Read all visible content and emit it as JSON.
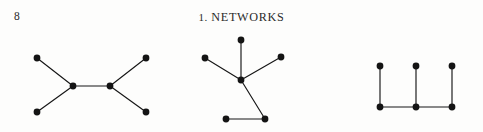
{
  "page": {
    "background_color": "#fdfdfc",
    "ink_color": "#141414",
    "width": 483,
    "height": 132
  },
  "running_head": {
    "folio": "8",
    "chapter_number": "1.",
    "chapter_title": "NETWORKS",
    "full_title": "1. NETWORKS"
  },
  "figures": {
    "node_radius": 3.4,
    "edge_color": "#161616",
    "node_color": "#141414",
    "graphs": [
      {
        "name": "graph-h-shape",
        "label": "left graph",
        "node_count": 6,
        "edge_count": 5,
        "nodes": [
          {
            "id": "a",
            "x": 37,
            "y": 30
          },
          {
            "id": "b",
            "x": 37,
            "y": 84
          },
          {
            "id": "c",
            "x": 73,
            "y": 58
          },
          {
            "id": "d",
            "x": 110,
            "y": 58
          },
          {
            "id": "e",
            "x": 146,
            "y": 30
          },
          {
            "id": "f",
            "x": 146,
            "y": 84
          }
        ],
        "edges": [
          {
            "from": "a",
            "to": "c"
          },
          {
            "from": "b",
            "to": "c"
          },
          {
            "from": "c",
            "to": "d"
          },
          {
            "from": "d",
            "to": "e"
          },
          {
            "from": "d",
            "to": "f"
          }
        ]
      },
      {
        "name": "graph-star-tree",
        "label": "middle graph",
        "node_count": 6,
        "edge_count": 5,
        "nodes": [
          {
            "id": "top",
            "x": 241,
            "y": 12
          },
          {
            "id": "left",
            "x": 205,
            "y": 30
          },
          {
            "id": "right",
            "x": 281,
            "y": 29
          },
          {
            "id": "hub",
            "x": 241,
            "y": 52
          },
          {
            "id": "lowerR",
            "x": 265,
            "y": 91
          },
          {
            "id": "lowerL",
            "x": 226,
            "y": 91
          }
        ],
        "edges": [
          {
            "from": "top",
            "to": "hub"
          },
          {
            "from": "left",
            "to": "hub"
          },
          {
            "from": "right",
            "to": "hub"
          },
          {
            "from": "hub",
            "to": "lowerR"
          },
          {
            "from": "lowerR",
            "to": "lowerL"
          }
        ]
      },
      {
        "name": "graph-comb-shape",
        "label": "right graph",
        "node_count": 6,
        "edge_count": 5,
        "nodes": [
          {
            "id": "t1",
            "x": 380,
            "y": 38
          },
          {
            "id": "t2",
            "x": 416,
            "y": 38
          },
          {
            "id": "t3",
            "x": 452,
            "y": 38
          },
          {
            "id": "b1",
            "x": 380,
            "y": 79
          },
          {
            "id": "b2",
            "x": 416,
            "y": 79
          },
          {
            "id": "b3",
            "x": 452,
            "y": 79
          }
        ],
        "edges": [
          {
            "from": "t1",
            "to": "b1"
          },
          {
            "from": "t2",
            "to": "b2"
          },
          {
            "from": "t3",
            "to": "b3"
          },
          {
            "from": "b1",
            "to": "b2"
          },
          {
            "from": "b2",
            "to": "b3"
          }
        ]
      }
    ]
  }
}
